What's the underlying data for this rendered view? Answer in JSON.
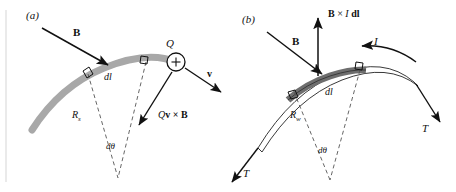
{
  "figure": {
    "type": "physics-diagram",
    "background": "#ffffff",
    "panels": [
      {
        "tag": "(a)",
        "subject": "charged particle stream in magnetic field",
        "arc_color": "#a8a8a8",
        "labels": {
          "field_vector": "B",
          "element": "dl",
          "radius": "R",
          "radius_subscript": "s",
          "angle": "dθ",
          "charge": "Q",
          "charge_sign": "+",
          "velocity": "v",
          "force": "Q",
          "force_rest": "v × B"
        }
      },
      {
        "tag": "(b)",
        "subject": "current carrying wire in magnetic field",
        "wire_fill": "#ffffff",
        "segment_fill": "#6e6e6e",
        "labels": {
          "field_vector": "B",
          "force_bold_b": "B",
          "force_mid": " × ",
          "force_current": "I",
          "force_dl": "dl",
          "current": "I",
          "element": "dl",
          "radius": "R",
          "radius_subscript": "w",
          "angle": "dθ",
          "tension_left": "T",
          "tension_right": "T"
        }
      }
    ]
  }
}
